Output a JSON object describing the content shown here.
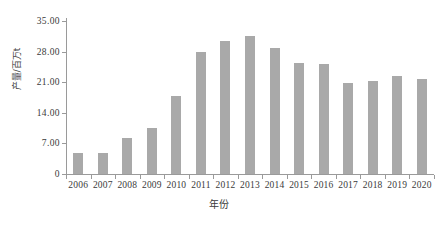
{
  "chart_data": {
    "type": "bar",
    "title": "",
    "subtitle": "",
    "xlabel": "年份",
    "ylabel": "产量/百万t",
    "categories": [
      "2006",
      "2007",
      "2008",
      "2009",
      "2010",
      "2011",
      "2012",
      "2013",
      "2014",
      "2015",
      "2016",
      "2017",
      "2018",
      "2019",
      "2020"
    ],
    "values": [
      4.8,
      4.8,
      8.2,
      10.5,
      17.8,
      28.0,
      30.4,
      31.5,
      28.8,
      25.3,
      25.1,
      20.8,
      21.2,
      22.5,
      21.8
    ],
    "series": [
      {
        "name": "产量",
        "values": [
          4.8,
          4.8,
          8.2,
          10.5,
          17.8,
          28.0,
          30.4,
          31.5,
          28.8,
          25.3,
          25.1,
          20.8,
          21.2,
          22.5,
          21.8
        ]
      }
    ],
    "ylim": [
      0,
      35
    ],
    "ytick_values": [
      0,
      7,
      14,
      21,
      28,
      35
    ],
    "ytick_labels": [
      "0",
      "7.00",
      "14.00",
      "21.00",
      "28.00",
      "35.00"
    ],
    "xtick_labels": [
      "2006",
      "2007",
      "2008",
      "2009",
      "2010",
      "2011",
      "2012",
      "2013",
      "2014",
      "2015",
      "2016",
      "2017",
      "2018",
      "2019",
      "2020"
    ],
    "grid": false,
    "legend": null,
    "legend_position": "none",
    "bar_color": "#a9a9a9",
    "axis_color": "#9a9a9a",
    "background_color": "#ffffff",
    "annotations": []
  }
}
